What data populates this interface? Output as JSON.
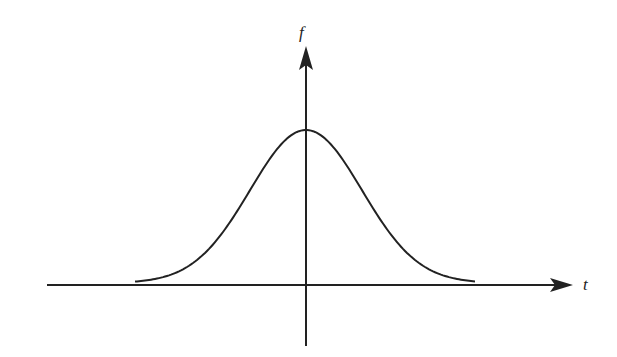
{
  "diagram": {
    "title": "",
    "axes": {
      "x_label": "t",
      "y_label": "f"
    },
    "curve": {
      "type": "gaussian",
      "color": "#222222"
    },
    "colors": {
      "axis": "#222222",
      "background": "#ffffff"
    }
  },
  "chart_data": {
    "type": "line",
    "title": "",
    "xlabel": "t",
    "ylabel": "f",
    "series": [
      {
        "name": "f(t)",
        "shape": "gaussian bell curve, symmetric about t=0, peak at t=0, tails approaching zero"
      }
    ],
    "grid": false,
    "legend": "none"
  }
}
